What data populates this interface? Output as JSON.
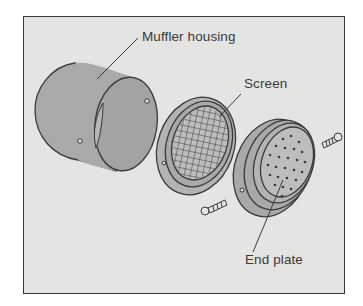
{
  "diagram": {
    "type": "exploded-view",
    "labels": {
      "housing": "Muffler housing",
      "screen": "Screen",
      "end_plate": "End plate"
    },
    "parts": [
      {
        "name": "Muffler housing",
        "shape": "cylinder"
      },
      {
        "name": "Screen",
        "shape": "ring with mesh"
      },
      {
        "name": "End plate",
        "shape": "perforated disc"
      },
      {
        "name": "screw",
        "count": 2
      }
    ],
    "colors": {
      "background": "#e4e4e2",
      "part_fill": "#a9a9a7",
      "outline": "#3a3a3a",
      "text": "#3a3a3a"
    }
  }
}
